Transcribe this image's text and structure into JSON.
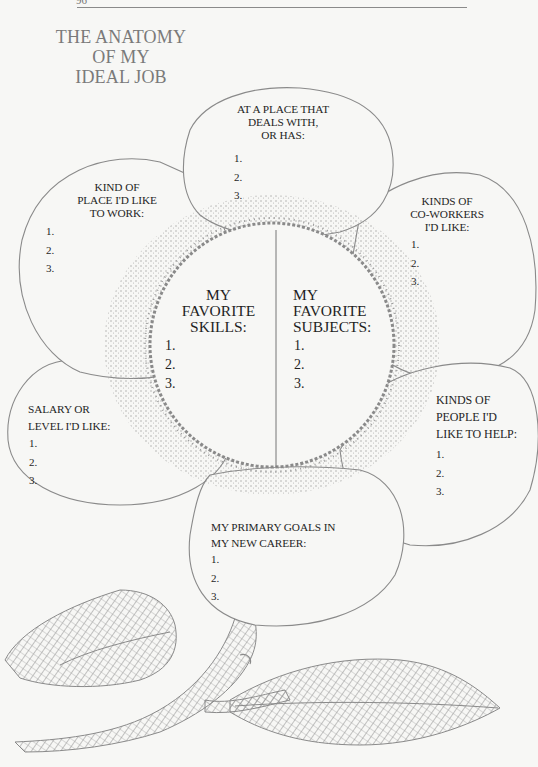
{
  "page": {
    "page_number": "96",
    "title_lines": [
      "THE ANATOMY",
      "OF MY",
      "IDEAL JOB"
    ]
  },
  "petals": {
    "top": {
      "label_lines": [
        "AT A PLACE THAT",
        "DEALS WITH,",
        "OR HAS:"
      ],
      "items": [
        "1.",
        "2.",
        "3."
      ]
    },
    "upper_left": {
      "label_lines": [
        "KIND OF",
        "PLACE I'D LIKE",
        "TO WORK:"
      ],
      "items": [
        "1.",
        "2.",
        "3."
      ]
    },
    "upper_right": {
      "label_lines": [
        "KINDS OF",
        "CO-WORKERS",
        "I'D LIKE:"
      ],
      "items": [
        "1.",
        "2.",
        "3."
      ]
    },
    "lower_left": {
      "label_lines": [
        "SALARY OR",
        "LEVEL I'D LIKE:"
      ],
      "items": [
        "1.",
        "2.",
        "3."
      ]
    },
    "lower_right": {
      "label_lines": [
        "KINDS OF",
        "PEOPLE I'D",
        "LIKE TO HELP:"
      ],
      "items": [
        "1.",
        "2.",
        "3."
      ]
    },
    "bottom": {
      "label_lines": [
        "MY PRIMARY GOALS IN",
        "MY NEW CAREER:"
      ],
      "items": [
        "1.",
        "2.",
        "3."
      ]
    }
  },
  "center": {
    "left": {
      "label_lines": [
        "MY",
        "FAVORITE",
        "SKILLS:"
      ],
      "items": [
        "1.",
        "2.",
        "3."
      ]
    },
    "right": {
      "label_lines": [
        "MY",
        "FAVORITE",
        "SUBJECTS:"
      ],
      "items": [
        "1.",
        "2.",
        "3."
      ]
    }
  },
  "illustration": {
    "ink_color": "#8a8a8a",
    "paper_color": "#f7f7f5"
  }
}
